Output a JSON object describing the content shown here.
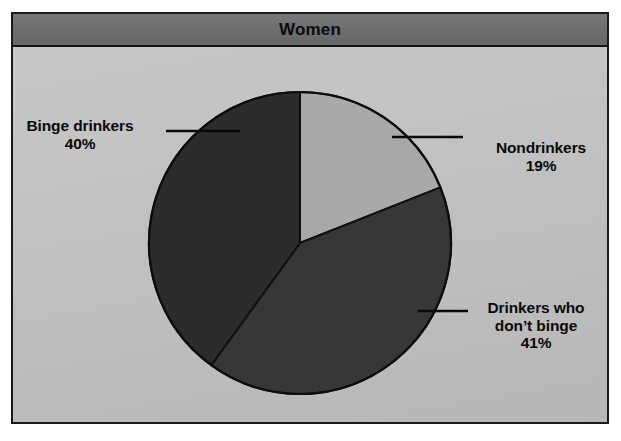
{
  "figure": {
    "title": "Women",
    "background_color": "#bdbdbd",
    "title_bar_color": "#6d6d6d",
    "border_color": "#1a1a1a"
  },
  "labels": {
    "binge": {
      "name": "Binge drinkers",
      "value": "40%"
    },
    "nondrinkers": {
      "name": "Nondrinkers",
      "value": "19%"
    },
    "nonbinge": {
      "name": "Drinkers who\ndon’t binge",
      "value": "41%"
    }
  },
  "icons": {
    "leader_line_left": "leader-line-icon",
    "leader_line_right_top": "leader-line-icon",
    "leader_line_right_bottom": "leader-line-icon"
  },
  "chart_data": {
    "type": "pie",
    "title": "Women",
    "xlabel": "",
    "ylabel": "",
    "legend_position": "callout-labels",
    "grid": false,
    "start_angle_deg": 0,
    "direction": "clockwise",
    "center": {
      "x": 300,
      "y": 243
    },
    "radius": 151,
    "categories": [
      "Nondrinkers",
      "Drinkers who don't binge",
      "Binge drinkers"
    ],
    "values": [
      19,
      41,
      40
    ],
    "value_unit": "percent",
    "slices": [
      {
        "label": "Nondrinkers",
        "value": 19,
        "display_value": "19%",
        "color": "#a9a9a9",
        "start_angle_deg": 0,
        "end_angle_deg": 68.4
      },
      {
        "label": "Drinkers who don't binge",
        "value": 41,
        "display_value": "41%",
        "color": "#373737",
        "start_angle_deg": 68.4,
        "end_angle_deg": 216.0
      },
      {
        "label": "Binge drinkers",
        "value": 40,
        "display_value": "40%",
        "color": "#2c2c2c",
        "start_angle_deg": 216.0,
        "end_angle_deg": 360.0
      }
    ]
  }
}
